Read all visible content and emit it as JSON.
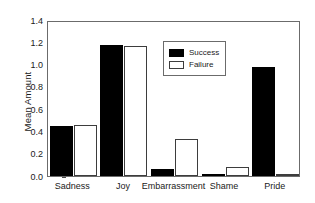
{
  "chart_data": {
    "type": "bar",
    "title": "",
    "xlabel": "",
    "ylabel": "Mean Amount",
    "categories": [
      "Sadness",
      "Joy",
      "Embarrassment",
      "Shame",
      "Pride"
    ],
    "series": [
      {
        "name": "Success",
        "color": "#000000",
        "values": [
          0.45,
          1.18,
          0.06,
          0.01,
          0.98
        ]
      },
      {
        "name": "Failure",
        "color": "#ffffff",
        "values": [
          0.46,
          1.17,
          0.33,
          0.08,
          0.005
        ]
      }
    ],
    "ylim": [
      0.0,
      1.4
    ],
    "ytick_values": [
      0.0,
      0.2,
      0.4,
      0.6,
      0.8,
      1.0,
      1.2,
      1.4
    ],
    "ytick_labels": [
      "0.0",
      "0.2",
      "0.4",
      "0.6",
      "0.8",
      "1.0",
      "1.2",
      "1.4"
    ],
    "grid": false,
    "legend_position": "upper-center",
    "frame_color": "#6b6b6b",
    "bar_edge_color": "#3d3d3d"
  },
  "legend": {
    "entries": [
      {
        "label": "Success",
        "swatch": "filled-black-swatch"
      },
      {
        "label": "Failure",
        "swatch": "outlined-white-swatch"
      }
    ]
  }
}
